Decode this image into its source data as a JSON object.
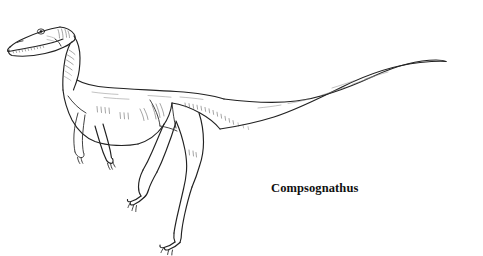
{
  "canvas": {
    "width": 483,
    "height": 256,
    "background_color": "#ffffff"
  },
  "illustration": {
    "subject": "dinosaur-line-drawing",
    "description": "Compsognathus, left-facing profile line drawing",
    "line_color": "#222222",
    "hatch_color": "#5a5a5a",
    "style": "black-and-white ink outline with sparse hatching"
  },
  "label": {
    "species_name": "Compsognathus",
    "color": "#101010"
  },
  "anatomy": {
    "parts": [
      "head",
      "snout",
      "teeth",
      "eye",
      "neck",
      "back",
      "body",
      "belly",
      "tail",
      "left-forelimb",
      "right-forelimb",
      "left-hindlimb",
      "right-hindlimb",
      "clawed-hand",
      "clawed-foot"
    ]
  }
}
